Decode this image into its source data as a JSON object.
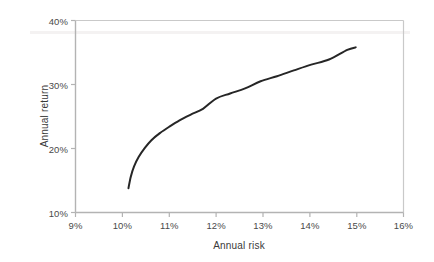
{
  "chart_data": {
    "type": "line",
    "title": "",
    "subtitle": "",
    "xlabel": "Annual risk",
    "ylabel": "Annual return",
    "xlim": [
      9,
      16
    ],
    "ylim": [
      10,
      40
    ],
    "xticks": [
      "9%",
      "10%",
      "11%",
      "12%",
      "13%",
      "14%",
      "15%",
      "16%"
    ],
    "xtick_values": [
      9,
      10,
      11,
      12,
      13,
      14,
      15,
      16
    ],
    "yticks": [
      "10%",
      "20%",
      "30%",
      "40%"
    ],
    "ytick_values": [
      10,
      20,
      30,
      40
    ],
    "grid": false,
    "legend": null,
    "legend_position": "none",
    "annotations": [],
    "series": [
      {
        "name": "Efficient frontier",
        "color": "#262626",
        "line_width": 2,
        "x": [
          10.13,
          10.18,
          10.25,
          10.35,
          10.48,
          10.62,
          10.8,
          11.0,
          11.22,
          11.46,
          11.72,
          12.0,
          12.3,
          12.62,
          12.95,
          13.3,
          13.66,
          14.03,
          14.41,
          14.8,
          14.98
        ],
        "y": [
          13.8,
          15.6,
          17.2,
          18.7,
          20.1,
          21.3,
          22.4,
          23.4,
          24.4,
          25.3,
          26.2,
          27.8,
          28.6,
          29.4,
          30.5,
          31.3,
          32.2,
          33.1,
          33.9,
          35.4,
          35.8
        ]
      }
    ],
    "axis_color": "#b3b3b3",
    "tick_label_color": "#4a4a4a"
  },
  "axes": {
    "y_title": "Annual return",
    "x_title": "Annual risk"
  },
  "xtick_labels": [
    "9%",
    "10%",
    "11%",
    "12%",
    "13%",
    "14%",
    "15%",
    "16%"
  ],
  "ytick_labels": [
    "40%",
    "30%",
    "20%",
    "10%"
  ]
}
